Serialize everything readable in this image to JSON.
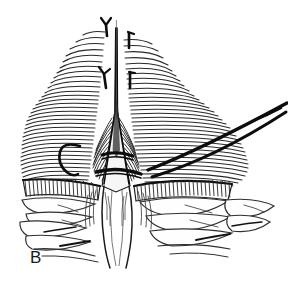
{
  "figure": {
    "panel_label": "B",
    "caption_text": "",
    "width": 288,
    "height": 283,
    "background_color": "#ffffff",
    "ink_color": "#1a1a1a",
    "mid_ink_color": "#3c3c3c",
    "light_ink_color": "#6b6b6b",
    "style": "pen-and-ink medical line drawing"
  },
  "illustration": {
    "subject": "midline abdominal fascial closure with interrupted suture",
    "regions": [
      {
        "name": "left-fascia-fan",
        "label": "left fascial sheet",
        "hatch_count": 34,
        "hatch_color": "#2a2a2a"
      },
      {
        "name": "right-fascia-fan",
        "label": "right fascial sheet",
        "hatch_count": 34,
        "hatch_color": "#2a2a2a"
      },
      {
        "name": "linea-alba-cone",
        "label": "midline raphe",
        "hatch_color": "#111111"
      },
      {
        "name": "muscle-band",
        "label": "striated muscle layer",
        "stripe_count": 52,
        "stripe_color": "#2a2a2a"
      },
      {
        "name": "fat-lobules",
        "label": "subcutaneous fat lobules",
        "lobule_count": 11,
        "outline_color": "#2f2f2f"
      }
    ],
    "instruments": [
      {
        "name": "curved-needle",
        "label": "curved suture needle",
        "color": "#0d0d0d"
      },
      {
        "name": "suture-thread-upper",
        "label": "suture thread limb 1",
        "color": "#0d0d0d"
      },
      {
        "name": "suture-thread-lower",
        "label": "suture thread limb 2",
        "color": "#0d0d0d"
      },
      {
        "name": "suture-band-upper",
        "label": "upper suture loop",
        "color": "#0d0d0d"
      },
      {
        "name": "suture-band-lower",
        "label": "lower suture loop",
        "color": "#0d0d0d"
      }
    ],
    "vessels": [
      {
        "name": "vessel-branch-upper",
        "label": "perforating vessel branch (upper)",
        "color": "#0d0d0d"
      },
      {
        "name": "vessel-branch-lower",
        "label": "perforating vessel branch (lower)",
        "color": "#0d0d0d"
      },
      {
        "name": "vessel-stub-upper-right",
        "label": "vessel stub (upper right)",
        "color": "#0d0d0d"
      },
      {
        "name": "vessel-stub-lower-right",
        "label": "vessel stub (lower right)",
        "color": "#0d0d0d"
      }
    ]
  }
}
